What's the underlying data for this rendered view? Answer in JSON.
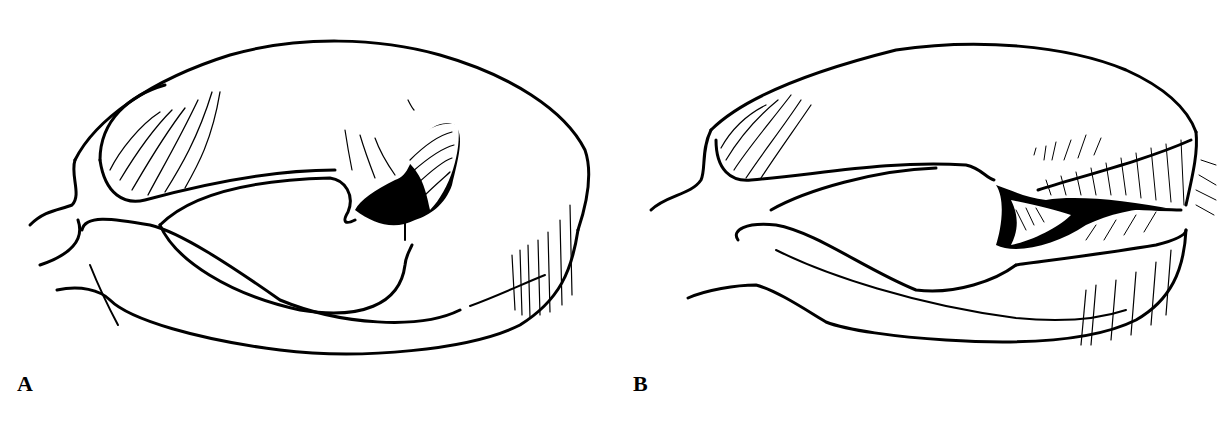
{
  "figure": {
    "panels": [
      {
        "id": "A",
        "label": "A",
        "description": "meniscus with partial tear (inner flap)"
      },
      {
        "id": "B",
        "label": "B",
        "description": "meniscus with full-thickness radial/flap tear"
      }
    ]
  },
  "colors": {
    "ink": "#000000",
    "background": "#ffffff"
  }
}
